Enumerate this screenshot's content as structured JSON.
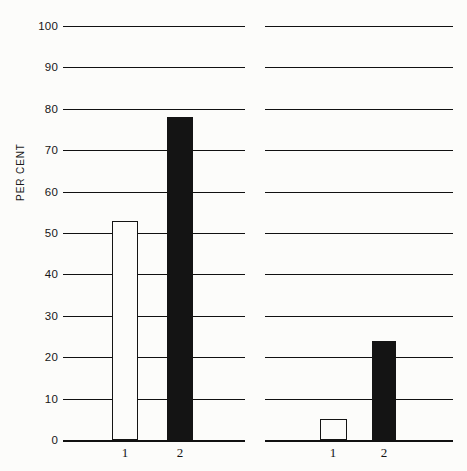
{
  "chart_data": {
    "type": "bar",
    "title": "",
    "xlabel": "",
    "ylabel": "PER CENT",
    "ylim": [
      0,
      100
    ],
    "ytick_step": 10,
    "ytick_labels": [
      "0",
      "10",
      "20",
      "30",
      "40",
      "50",
      "60",
      "70",
      "80",
      "90",
      "100"
    ],
    "ytick_values": [
      0,
      10,
      20,
      30,
      40,
      50,
      60,
      70,
      80,
      90,
      100
    ],
    "grid": true,
    "legend": "none",
    "categories": [
      "1",
      "2"
    ],
    "panels": [
      {
        "name": "left-panel",
        "bars": [
          {
            "category": "1",
            "value": 53,
            "style": "open"
          },
          {
            "category": "2",
            "value": 78,
            "style": "filled"
          }
        ]
      },
      {
        "name": "right-panel",
        "bars": [
          {
            "category": "1",
            "value": 5,
            "style": "open"
          },
          {
            "category": "2",
            "value": 24,
            "style": "filled"
          }
        ]
      }
    ],
    "series": [
      {
        "name": "open",
        "values": [
          53,
          5
        ]
      },
      {
        "name": "filled",
        "values": [
          78,
          24
        ]
      }
    ],
    "colors": {
      "open_fill": "#fcfcfa",
      "open_stroke": "#141414",
      "filled": "#141414",
      "gridline": "#111111",
      "background": "#fcfcfa",
      "text": "#161616"
    }
  },
  "geometry": {
    "y_top_px": 26,
    "y_bottom_px": 440,
    "panels": [
      {
        "grid_left": 63,
        "grid_right": 245,
        "bars": [
          {
            "x": 112,
            "width": 26
          },
          {
            "x": 167,
            "width": 26
          }
        ],
        "label_x": [
          125,
          180
        ],
        "label_y": 445
      },
      {
        "grid_left": 265,
        "grid_right": 453,
        "bars": [
          {
            "x": 320,
            "width": 27
          },
          {
            "x": 372,
            "width": 24
          }
        ],
        "label_x": [
          333,
          384
        ],
        "label_y": 445
      }
    ]
  }
}
